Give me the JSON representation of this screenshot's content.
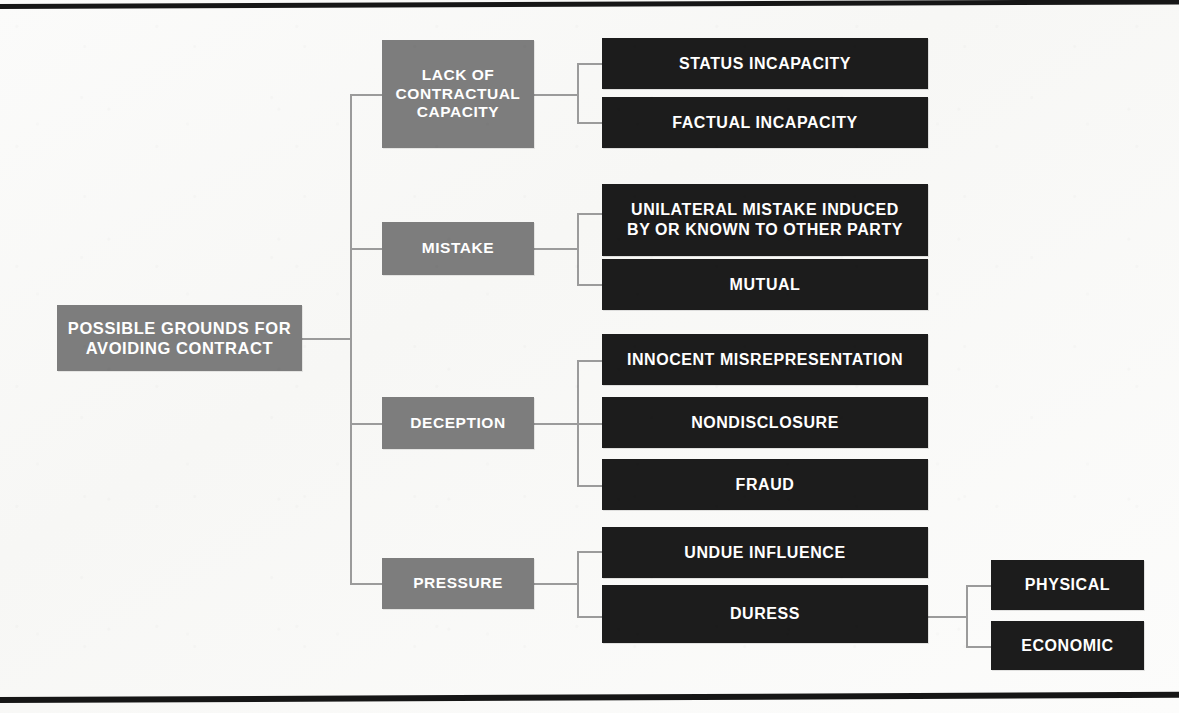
{
  "diagram": {
    "title_root": "POSSIBLE GROUNDS FOR AVOIDING CONTRACT",
    "colors": {
      "level1_box": "#7d7d7d",
      "level2_box": "#1c1c1c",
      "connector": "#9b9b9b",
      "rule": "#161616",
      "text": "#ffffff",
      "background": "#fbfbfa"
    },
    "root": {
      "label": "POSSIBLE GROUNDS FOR AVOIDING CONTRACT",
      "line1": "POSSIBLE GROUNDS FOR",
      "line2": "AVOIDING CONTRACT"
    },
    "branches": [
      {
        "label": "LACK OF CONTRACTUAL CAPACITY",
        "line1": "LACK OF",
        "line2": "CONTRACTUAL",
        "line3": "CAPACITY",
        "children": [
          {
            "label": "STATUS INCAPACITY"
          },
          {
            "label": "FACTUAL INCAPACITY"
          }
        ]
      },
      {
        "label": "MISTAKE",
        "line1": "MISTAKE",
        "children": [
          {
            "label": "UNILATERAL MISTAKE INDUCED BY OR KNOWN TO OTHER PARTY",
            "line1": "UNILATERAL MISTAKE INDUCED",
            "line2": "BY OR KNOWN TO OTHER PARTY"
          },
          {
            "label": "MUTUAL"
          }
        ]
      },
      {
        "label": "DECEPTION",
        "line1": "DECEPTION",
        "children": [
          {
            "label": "INNOCENT MISREPRESENTATION"
          },
          {
            "label": "NONDISCLOSURE"
          },
          {
            "label": "FRAUD"
          }
        ]
      },
      {
        "label": "PRESSURE",
        "line1": "PRESSURE",
        "children": [
          {
            "label": "UNDUE INFLUENCE"
          },
          {
            "label": "DURESS",
            "children": [
              {
                "label": "PHYSICAL"
              },
              {
                "label": "ECONOMIC"
              }
            ]
          }
        ]
      }
    ]
  }
}
